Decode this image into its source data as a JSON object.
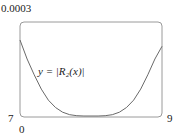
{
  "chart_data": {
    "type": "line",
    "title": "",
    "xlabel": "",
    "ylabel": "",
    "xlim": [
      7,
      9
    ],
    "ylim": [
      0,
      0.0003
    ],
    "x_tick_labels": [
      "7",
      "9"
    ],
    "y_tick_labels": [
      "0",
      "0.0003"
    ],
    "annotations": [
      "y = |R₂(x)|"
    ],
    "grid": false,
    "series": [
      {
        "name": "y = |R₂(x)|",
        "x": [
          7.0,
          7.1,
          7.2,
          7.3,
          7.4,
          7.5,
          7.6,
          7.7,
          7.8,
          7.9,
          8.0,
          8.1,
          8.2,
          8.3,
          8.4,
          8.5,
          8.6,
          8.7,
          8.8,
          8.9,
          9.0
        ],
        "values": [
          0.00024,
          0.00018,
          0.00013,
          8.5e-05,
          5e-05,
          2.7e-05,
          1.2e-05,
          4e-06,
          1e-06,
          1e-07,
          0.0,
          1e-07,
          1e-06,
          4e-06,
          1.2e-05,
          2.7e-05,
          5e-05,
          8.5e-05,
          0.00013,
          0.00018,
          0.00022
        ]
      }
    ]
  },
  "labels": {
    "y_max": "0.0003",
    "y_min": "0",
    "x_min": "7",
    "x_max": "9",
    "curve_label": "y = |R₂(x)|"
  }
}
